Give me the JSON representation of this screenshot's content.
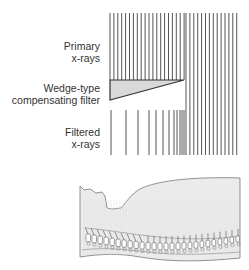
{
  "labels": {
    "primary": {
      "line1": "Primary",
      "line2": "x-rays"
    },
    "wedge": {
      "line1": "Wedge-type",
      "line2": "compensating filter"
    },
    "filtered": {
      "line1": "Filtered",
      "line2": "x-rays"
    }
  },
  "colors": {
    "line": "#555555",
    "wedge_fill": "#d9d9d9",
    "body_fill": "#e8e8e8",
    "outline": "#666666"
  },
  "geometry": {
    "primary_top": 13,
    "primary_bottom_left": 80,
    "primary_bottom_right": 155,
    "left_x": 110,
    "split_x": 185,
    "right_x": 240,
    "spacing": 3.9,
    "wedge": {
      "top_y": 80,
      "bottom_left_y": 100,
      "tip_x": 184
    },
    "filtered_top": 110,
    "filtered_bottom": 155,
    "filtered_x": [
      111,
      126,
      138,
      149,
      156,
      163,
      169,
      174,
      177,
      180,
      182,
      184
    ]
  }
}
